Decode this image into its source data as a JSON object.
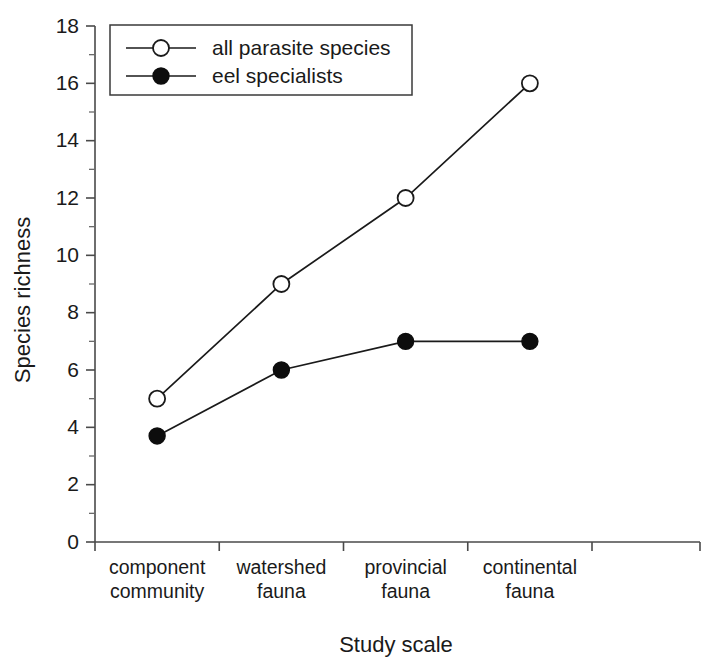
{
  "chart_data": {
    "type": "line",
    "title": "",
    "subtitle": "",
    "xlabel": "Study scale",
    "ylabel": "Species richness",
    "categories": [
      "component\ncommunity",
      "watershed\nfauna",
      "provincial\nfauna",
      "continental\nfauna"
    ],
    "category_lines": [
      [
        "component",
        "community"
      ],
      [
        "watershed",
        "fauna"
      ],
      [
        "provincial",
        "fauna"
      ],
      [
        "continental",
        "fauna"
      ]
    ],
    "ylim": [
      0,
      18
    ],
    "ytick_step": 2,
    "yticks": [
      0,
      2,
      4,
      6,
      8,
      10,
      12,
      14,
      16,
      18
    ],
    "ytick_labels": [
      "0",
      "2",
      "4",
      "6",
      "8",
      "10",
      "12",
      "14",
      "16",
      "18"
    ],
    "yminor_step": 1,
    "grid": false,
    "legend_position": "top-left",
    "series": [
      {
        "name": "all parasite species",
        "marker": "open-circle",
        "color": "#1a1a1a",
        "values": [
          5,
          9,
          12,
          16
        ]
      },
      {
        "name": "eel specialists",
        "marker": "filled-circle",
        "color": "#0d0d0d",
        "values": [
          3.7,
          6,
          7,
          7
        ]
      }
    ]
  },
  "legend": {
    "entries": [
      {
        "label": "all parasite species",
        "marker": "open-circle"
      },
      {
        "label": "eel specialists",
        "marker": "filled-circle"
      }
    ]
  },
  "axes": {
    "y_title": "Species richness",
    "x_title": "Study scale"
  }
}
